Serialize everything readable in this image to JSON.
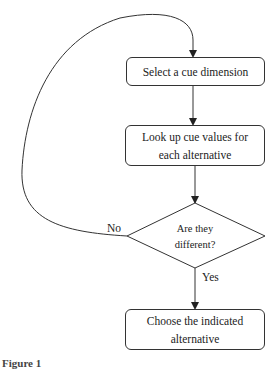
{
  "flowchart": {
    "step1": "Select a cue dimension",
    "step2": "Look up cue values for each alternative",
    "decision": "Are they different?",
    "no_label": "No",
    "yes_label": "Yes",
    "step3": "Choose the indicated alternative"
  },
  "caption": "Figure 1"
}
